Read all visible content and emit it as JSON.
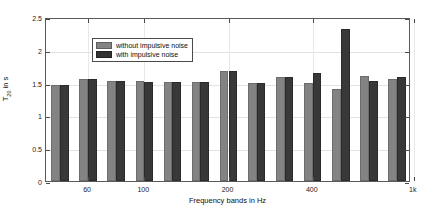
{
  "chart_data": {
    "type": "bar",
    "title": "",
    "xlabel": "Frequency bands in Hz",
    "ylabel": "T20 in s",
    "ylabel_base": "T",
    "ylabel_sub": "20",
    "ylabel_unit": " in s",
    "categories": [
      "50",
      "63",
      "80",
      "100",
      "125",
      "160",
      "200",
      "250",
      "315",
      "400",
      "500",
      "630",
      "800"
    ],
    "series": [
      {
        "name": "without impulsive noise",
        "color": "#838383",
        "values": [
          1.47,
          1.55,
          1.52,
          1.52,
          1.51,
          1.51,
          1.68,
          1.5,
          1.59,
          1.49,
          1.4,
          1.6,
          1.55
        ]
      },
      {
        "name": "with impulsive noise",
        "color": "#333333",
        "values": [
          1.47,
          1.55,
          1.52,
          1.51,
          1.51,
          1.51,
          1.68,
          1.5,
          1.59,
          1.64,
          2.32,
          1.53,
          1.59
        ]
      }
    ],
    "ylim": [
      0,
      2.5
    ],
    "ytick_labels": [
      "0",
      "0.5",
      "1",
      "1.5",
      "2",
      "2.5"
    ],
    "ytick_values": [
      0,
      0.5,
      1,
      1.5,
      2,
      2.5
    ],
    "xtick_labels": [
      "60",
      "100",
      "200",
      "400",
      "1k"
    ],
    "xtick_positions": [
      1.0,
      3.0,
      6.0,
      9.0,
      12.6
    ],
    "grid": true,
    "legend_position": "upper-left"
  },
  "legend": {
    "entries": [
      {
        "label": "without impulsive noise"
      },
      {
        "label": "with impulsive noise"
      }
    ]
  }
}
